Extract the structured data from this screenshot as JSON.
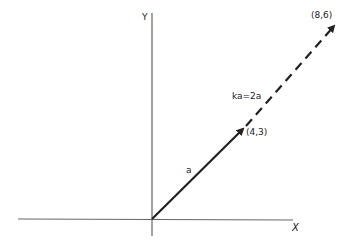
{
  "diagram": {
    "axes": {
      "x_label": "X",
      "y_label": "Y"
    },
    "vectors": [
      {
        "name": "a",
        "label": "a",
        "tip_label": "(4,3)",
        "style": "solid"
      },
      {
        "name": "ka",
        "label": "ka=2a",
        "tip_label": "(8,6)",
        "style": "dashed"
      }
    ],
    "colors": {
      "axis": "#555555",
      "vector": "#222222",
      "background": "#ffffff"
    }
  }
}
